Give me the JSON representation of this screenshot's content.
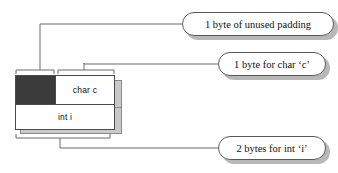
{
  "diagram": {
    "title_text": "",
    "type": "memory-layout",
    "colors": {
      "padding_fill": "#3b3b3b",
      "cell_fill": "#ffffff",
      "outline": "#4a4a4a",
      "leader_line": "#6a6a6a",
      "shadow": "#b8b8b8"
    },
    "memory_block": {
      "rows": [
        {
          "name": "top-row",
          "cells": [
            {
              "name": "padding-cell",
              "label": "",
              "fill": "#3b3b3b",
              "bytes": 1
            },
            {
              "name": "char-cell",
              "label": "char c",
              "fill": "#ffffff",
              "bytes": 1
            }
          ]
        },
        {
          "name": "bottom-row",
          "cells": [
            {
              "name": "int-cell",
              "label": "int i",
              "fill": "#ffffff",
              "bytes": 2
            }
          ]
        }
      ]
    },
    "braces": [
      {
        "name": "brace-padding",
        "spans": "padding-cell",
        "position": "top"
      },
      {
        "name": "brace-char",
        "spans": "char-cell",
        "position": "top"
      },
      {
        "name": "brace-int",
        "spans": "bottom-row",
        "position": "bottom"
      }
    ],
    "callouts": [
      {
        "name": "callout-padding",
        "text": "1 byte of unused padding",
        "points_to": "padding-cell"
      },
      {
        "name": "callout-char",
        "text": "1 byte for char ‘c’",
        "points_to": "char-cell"
      },
      {
        "name": "callout-int",
        "text": "2 bytes for int ‘i’",
        "points_to": "int-cell"
      }
    ]
  }
}
